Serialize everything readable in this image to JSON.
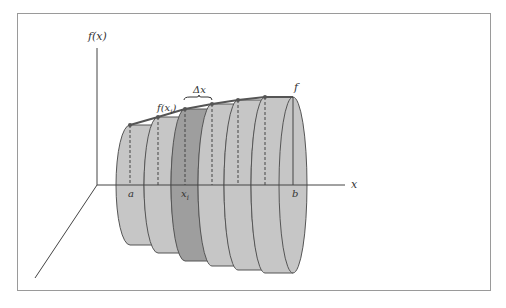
{
  "figure": {
    "labels": {
      "y_axis": "f(x)",
      "x_axis": "x",
      "curve": "f",
      "sample_point": "f(x",
      "sample_point_sub": "i",
      "sample_point_close": ")",
      "delta": "Δx",
      "lower_bound": "a",
      "xi": "x",
      "xi_sub": "i",
      "upper_bound": "b"
    },
    "colors": {
      "disk_fill": "#c6c6c6",
      "highlight_disk_fill": "#9e9e9e",
      "outline": "#555555",
      "axis": "#444444"
    },
    "disks": [
      {
        "x0": 130,
        "x1": 158,
        "r": 60,
        "highlight": false
      },
      {
        "x0": 158,
        "x1": 185,
        "r": 68,
        "highlight": false
      },
      {
        "x0": 185,
        "x1": 212,
        "r": 76,
        "highlight": true
      },
      {
        "x0": 212,
        "x1": 238,
        "r": 81,
        "highlight": false
      },
      {
        "x0": 238,
        "x1": 265,
        "r": 85,
        "highlight": false
      },
      {
        "x0": 265,
        "x1": 293,
        "r": 88,
        "highlight": false
      }
    ]
  }
}
